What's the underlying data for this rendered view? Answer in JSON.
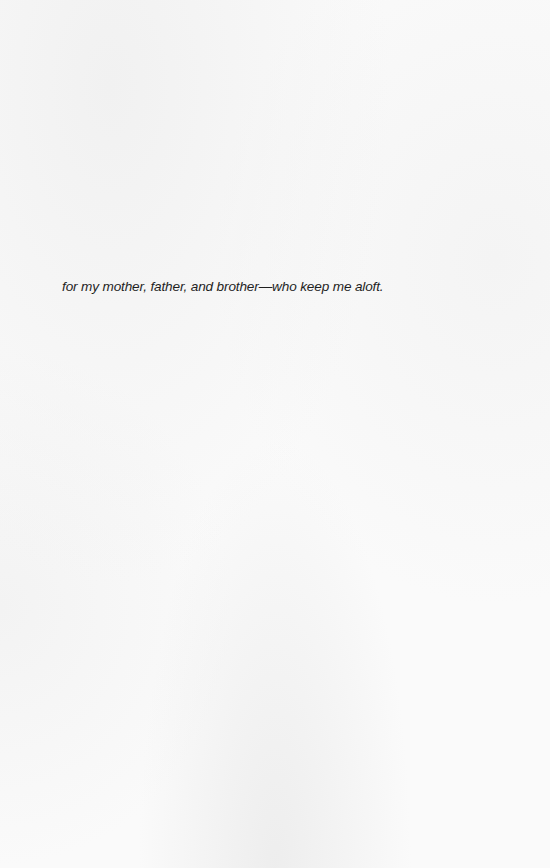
{
  "page": {
    "type": "dedication",
    "background_color": "#fafafa",
    "text_color": "#1f1f1f"
  },
  "dedication": {
    "text": "for my mother, father, and brother—who keep me aloft."
  }
}
